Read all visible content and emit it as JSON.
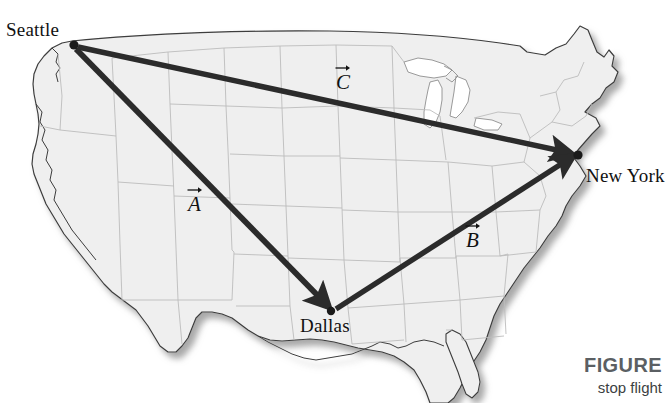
{
  "figure": {
    "type": "map-diagram",
    "background_color": "#ffffff",
    "map_fill_color": "#efefef",
    "map_outline_color": "#3a3a3a",
    "state_border_color": "#b9b9b9",
    "vector_color": "#2b2b2b"
  },
  "cities": [
    {
      "name": "Seattle",
      "label": "Seattle",
      "x": 73,
      "y": 45
    },
    {
      "name": "New York",
      "label": "New York",
      "x": 578,
      "y": 155
    },
    {
      "name": "Dallas",
      "label": "Dallas",
      "x": 331,
      "y": 311
    }
  ],
  "vectors": [
    {
      "id": "A",
      "label": "A",
      "from": "Seattle",
      "to": "Dallas",
      "start": {
        "x": 75,
        "y": 47
      },
      "end": {
        "x": 328,
        "y": 307
      },
      "label_x": 188,
      "label_y": 192
    },
    {
      "id": "B",
      "label": "B",
      "from": "Dallas",
      "to": "New York",
      "start": {
        "x": 336,
        "y": 309
      },
      "end": {
        "x": 574,
        "y": 158
      },
      "label_x": 466,
      "label_y": 228
    },
    {
      "id": "C",
      "label": "C",
      "from": "Seattle",
      "to": "New York",
      "start": {
        "x": 78,
        "y": 47
      },
      "end": {
        "x": 572,
        "y": 153
      },
      "label_x": 336,
      "label_y": 70
    }
  ],
  "caption": {
    "title": "FIGURE",
    "subtitle": "stop flight"
  }
}
